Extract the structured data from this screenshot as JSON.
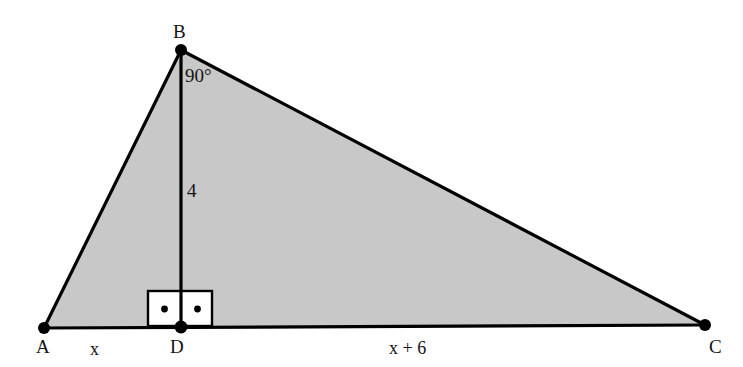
{
  "figure": {
    "type": "geometry-diagram",
    "shape": "triangle",
    "background_color": "#ffffff",
    "fill_color": "#c8c8c8",
    "stroke_color": "#000000",
    "vertices": [
      {
        "name": "A",
        "x": 44,
        "y": 328
      },
      {
        "name": "B",
        "x": 181,
        "y": 50
      },
      {
        "name": "C",
        "x": 705,
        "y": 325
      },
      {
        "name": "D",
        "x": 181,
        "y": 327
      }
    ],
    "segments": [
      {
        "name": "AB",
        "from": "A",
        "to": "B"
      },
      {
        "name": "BC",
        "from": "B",
        "to": "C"
      },
      {
        "name": "AC",
        "from": "A",
        "to": "C"
      },
      {
        "name": "BD",
        "from": "B",
        "to": "D"
      }
    ],
    "right_angle_marker": {
      "name": "right-angle-marker-at-D",
      "x": 148,
      "y": 291,
      "width": 64,
      "height": 35,
      "fill": "#ffffff",
      "dots": 2
    }
  },
  "labels": {
    "vertex_a": "A",
    "vertex_b": "B",
    "vertex_c": "C",
    "vertex_d": "D",
    "angle_at_b": "90°",
    "altitude_length": "4",
    "segment_ad": "x",
    "segment_dc": "x + 6"
  }
}
